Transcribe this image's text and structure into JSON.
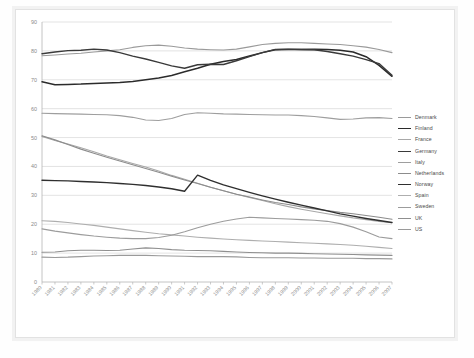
{
  "chart_data": {
    "type": "line",
    "title": "",
    "xlabel": "",
    "ylabel": "",
    "xlim": [
      1980,
      2007
    ],
    "ylim": [
      0,
      90
    ],
    "ytick_step": 10,
    "grid": true,
    "legend_position": "right",
    "yticks": [
      0,
      10,
      20,
      30,
      40,
      50,
      60,
      70,
      80,
      90
    ],
    "categories": [
      "1980",
      "1981",
      "1982",
      "1983",
      "1984",
      "1985",
      "1986",
      "1987",
      "1988",
      "1989",
      "1990",
      "1991",
      "1992",
      "1993",
      "1994",
      "1995",
      "1996",
      "1997",
      "1998",
      "1999",
      "2000",
      "2001",
      "2002",
      "2003",
      "2004",
      "2005",
      "2006",
      "2007"
    ],
    "series": [
      {
        "name": "Denmark",
        "color": "#9a9a9a",
        "width": 1.1,
        "values": [
          78.3,
          78.6,
          78.9,
          79.2,
          79.6,
          80.0,
          80.4,
          81.2,
          81.8,
          82.0,
          81.6,
          81.0,
          80.6,
          80.4,
          80.3,
          80.6,
          81.4,
          82.2,
          82.6,
          82.8,
          82.8,
          82.6,
          82.4,
          82.2,
          81.8,
          81.3,
          80.5,
          79.4
        ]
      },
      {
        "name": "Finland",
        "color": "#2b2b2b",
        "width": 1.5,
        "values": [
          69.3,
          68.3,
          68.4,
          68.5,
          68.7,
          68.9,
          69.1,
          69.4,
          70.0,
          70.6,
          71.5,
          72.8,
          74.0,
          75.4,
          76.3,
          77.0,
          78.2,
          79.4,
          80.4,
          80.5,
          80.5,
          80.6,
          80.5,
          80.2,
          79.6,
          78.0,
          75.0,
          71.2
        ]
      },
      {
        "name": "France",
        "color": "#a8a8a8",
        "width": 1.1,
        "values": [
          50.4,
          49.0,
          47.8,
          46.5,
          45.1,
          43.6,
          42.3,
          41.0,
          39.8,
          38.4,
          36.9,
          35.6,
          34.2,
          32.8,
          31.6,
          30.4,
          29.3,
          28.2,
          27.1,
          26.1,
          25.2,
          24.4,
          23.6,
          22.9,
          22.2,
          21.6,
          21.0,
          20.5
        ]
      },
      {
        "name": "Germany",
        "color": "#3a3a3a",
        "width": 1.4,
        "values": [
          79.0,
          79.6,
          80.1,
          80.2,
          80.6,
          80.3,
          79.4,
          78.2,
          77.2,
          76.0,
          74.8,
          74.0,
          75.2,
          75.4,
          75.3,
          76.6,
          78.0,
          79.4,
          80.5,
          80.6,
          80.5,
          80.4,
          79.8,
          79.0,
          78.2,
          77.0,
          75.6,
          71.6
        ]
      },
      {
        "name": "Italy",
        "color": "#9e9e9e",
        "width": 1.1,
        "values": [
          58.4,
          58.3,
          58.2,
          58.1,
          58.0,
          57.9,
          57.6,
          57.0,
          56.1,
          55.9,
          56.6,
          58.0,
          58.6,
          58.4,
          58.2,
          58.1,
          58.0,
          57.9,
          57.8,
          57.8,
          57.6,
          57.3,
          56.8,
          56.3,
          56.4,
          56.8,
          56.9,
          56.6
        ]
      },
      {
        "name": "Netherlands",
        "color": "#8c8c8c",
        "width": 1.1,
        "values": [
          50.6,
          49.2,
          47.6,
          46.0,
          44.6,
          43.2,
          41.9,
          40.6,
          39.3,
          38.0,
          36.6,
          35.3,
          34.1,
          32.8,
          31.6,
          30.4,
          29.4,
          28.4,
          27.5,
          26.8,
          26.0,
          25.3,
          24.7,
          24.1,
          23.6,
          23.0,
          22.4,
          21.7
        ]
      },
      {
        "name": "Norway",
        "color": "#2f2f2f",
        "width": 1.4,
        "values": [
          35.2,
          35.1,
          35.0,
          34.8,
          34.6,
          34.4,
          34.1,
          33.8,
          33.4,
          32.9,
          32.3,
          31.4,
          37.0,
          35.2,
          33.6,
          32.3,
          31.0,
          29.8,
          28.7,
          27.6,
          26.6,
          25.6,
          24.6,
          23.6,
          22.8,
          22.0,
          21.3,
          20.6
        ]
      },
      {
        "name": "Spain",
        "color": "#aeaeae",
        "width": 1.1,
        "values": [
          21.2,
          21.0,
          20.6,
          20.1,
          19.6,
          19.0,
          18.4,
          17.8,
          17.2,
          16.7,
          16.3,
          15.9,
          15.5,
          15.2,
          14.9,
          14.6,
          14.4,
          14.2,
          14.0,
          13.8,
          13.6,
          13.4,
          13.2,
          13.0,
          12.7,
          12.4,
          12.0,
          11.6
        ]
      },
      {
        "name": "Sweden",
        "color": "#9c9c9c",
        "width": 1.1,
        "values": [
          18.4,
          17.6,
          17.0,
          16.4,
          15.9,
          15.5,
          15.2,
          15.0,
          15.0,
          15.4,
          16.2,
          17.4,
          18.8,
          20.0,
          21.0,
          21.8,
          22.4,
          22.2,
          22.0,
          21.8,
          21.6,
          21.4,
          21.0,
          20.2,
          19.0,
          17.4,
          15.6,
          15.0
        ]
      },
      {
        "name": "UK",
        "color": "#8f8f8f",
        "width": 1.1,
        "values": [
          10.3,
          10.4,
          10.8,
          11.0,
          11.0,
          10.9,
          11.0,
          11.4,
          11.8,
          11.6,
          11.2,
          11.0,
          10.9,
          10.8,
          10.6,
          10.4,
          10.2,
          10.1,
          10.0,
          10.0,
          9.9,
          9.8,
          9.7,
          9.6,
          9.5,
          9.4,
          9.3,
          9.2
        ]
      },
      {
        "name": "US",
        "color": "#9a9a9a",
        "width": 1.1,
        "values": [
          8.6,
          8.5,
          8.6,
          8.8,
          9.0,
          9.1,
          9.2,
          9.2,
          9.2,
          9.1,
          9.0,
          8.9,
          8.8,
          8.8,
          8.8,
          8.7,
          8.5,
          8.4,
          8.4,
          8.4,
          8.3,
          8.3,
          8.2,
          8.2,
          8.2,
          8.1,
          8.1,
          8.0
        ]
      }
    ]
  }
}
